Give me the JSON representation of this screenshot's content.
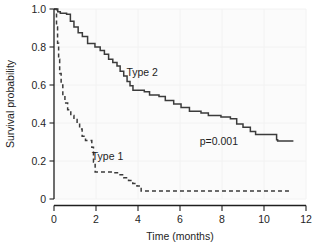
{
  "chart_data": {
    "type": "line",
    "title": "",
    "subtitle": "",
    "xlabel": "Time (months)",
    "ylabel": "Survival probability",
    "xlim": [
      0,
      12
    ],
    "ylim": [
      0,
      1.0
    ],
    "xticks": [
      "0",
      "2",
      "4",
      "6",
      "8",
      "10",
      "12"
    ],
    "xtick_values": [
      0,
      2,
      4,
      6,
      8,
      10,
      12
    ],
    "yticks": [
      "0",
      "0.2",
      "0.4",
      "0.6",
      "0.8",
      "1.0"
    ],
    "ytick_values": [
      0,
      0.2,
      0.4,
      0.6,
      0.8,
      1.0
    ],
    "grid": true,
    "legend_position": "inline-annotations",
    "annotations": [
      {
        "text": "Type 2",
        "x": 4.2,
        "y": 0.645,
        "name": "type-2-curve-label"
      },
      {
        "text": "Type 1",
        "x": 2.55,
        "y": 0.205,
        "name": "type-1-curve-label"
      },
      {
        "text": "p=0.001",
        "x": 7.85,
        "y": 0.285,
        "name": "p-value-annotation"
      }
    ],
    "series": [
      {
        "name": "Type 2",
        "style": "solid",
        "color": "#3b3b3b",
        "step": "post",
        "points": [
          [
            0.0,
            1.0
          ],
          [
            0.18,
            1.0
          ],
          [
            0.22,
            0.985
          ],
          [
            0.3,
            0.985
          ],
          [
            0.34,
            0.978
          ],
          [
            0.6,
            0.978
          ],
          [
            0.64,
            0.972
          ],
          [
            0.78,
            0.972
          ],
          [
            0.82,
            0.935
          ],
          [
            0.95,
            0.935
          ],
          [
            1.0,
            0.905
          ],
          [
            1.15,
            0.905
          ],
          [
            1.2,
            0.875
          ],
          [
            1.35,
            0.875
          ],
          [
            1.4,
            0.855
          ],
          [
            1.6,
            0.855
          ],
          [
            1.65,
            0.818
          ],
          [
            1.95,
            0.818
          ],
          [
            2.0,
            0.8
          ],
          [
            2.2,
            0.8
          ],
          [
            2.25,
            0.782
          ],
          [
            2.4,
            0.782
          ],
          [
            2.45,
            0.762
          ],
          [
            2.6,
            0.762
          ],
          [
            2.65,
            0.735
          ],
          [
            2.8,
            0.735
          ],
          [
            2.85,
            0.718
          ],
          [
            3.0,
            0.718
          ],
          [
            3.05,
            0.7
          ],
          [
            3.15,
            0.7
          ],
          [
            3.2,
            0.672
          ],
          [
            3.32,
            0.672
          ],
          [
            3.36,
            0.648
          ],
          [
            3.48,
            0.648
          ],
          [
            3.52,
            0.618
          ],
          [
            3.62,
            0.618
          ],
          [
            3.66,
            0.596
          ],
          [
            3.76,
            0.596
          ],
          [
            3.8,
            0.572
          ],
          [
            4.3,
            0.572
          ],
          [
            4.34,
            0.565
          ],
          [
            4.55,
            0.565
          ],
          [
            4.6,
            0.548
          ],
          [
            5.0,
            0.548
          ],
          [
            5.05,
            0.54
          ],
          [
            5.3,
            0.54
          ],
          [
            5.35,
            0.518
          ],
          [
            5.7,
            0.518
          ],
          [
            5.75,
            0.5
          ],
          [
            6.05,
            0.5
          ],
          [
            6.1,
            0.482
          ],
          [
            6.45,
            0.482
          ],
          [
            6.5,
            0.462
          ],
          [
            7.0,
            0.462
          ],
          [
            7.05,
            0.452
          ],
          [
            7.35,
            0.452
          ],
          [
            7.4,
            0.44
          ],
          [
            7.95,
            0.44
          ],
          [
            8.0,
            0.432
          ],
          [
            8.4,
            0.432
          ],
          [
            8.45,
            0.422
          ],
          [
            8.7,
            0.422
          ],
          [
            8.75,
            0.395
          ],
          [
            9.0,
            0.395
          ],
          [
            9.05,
            0.378
          ],
          [
            9.35,
            0.378
          ],
          [
            9.4,
            0.355
          ],
          [
            9.6,
            0.355
          ],
          [
            9.65,
            0.34
          ],
          [
            10.6,
            0.34
          ],
          [
            10.65,
            0.312
          ],
          [
            10.7,
            0.305
          ],
          [
            11.4,
            0.305
          ]
        ]
      },
      {
        "name": "Type 1",
        "style": "dashed",
        "color": "#3b3b3b",
        "step": "post",
        "points": [
          [
            0.0,
            1.0
          ],
          [
            0.12,
            1.0
          ],
          [
            0.14,
            0.905
          ],
          [
            0.17,
            0.905
          ],
          [
            0.19,
            0.82
          ],
          [
            0.22,
            0.82
          ],
          [
            0.24,
            0.735
          ],
          [
            0.27,
            0.735
          ],
          [
            0.3,
            0.66
          ],
          [
            0.34,
            0.66
          ],
          [
            0.37,
            0.6
          ],
          [
            0.42,
            0.6
          ],
          [
            0.46,
            0.545
          ],
          [
            0.52,
            0.545
          ],
          [
            0.57,
            0.505
          ],
          [
            0.65,
            0.505
          ],
          [
            0.7,
            0.47
          ],
          [
            0.8,
            0.47
          ],
          [
            0.85,
            0.44
          ],
          [
            0.95,
            0.44
          ],
          [
            1.0,
            0.418
          ],
          [
            1.1,
            0.418
          ],
          [
            1.15,
            0.4
          ],
          [
            1.22,
            0.4
          ],
          [
            1.26,
            0.368
          ],
          [
            1.34,
            0.368
          ],
          [
            1.38,
            0.33
          ],
          [
            1.5,
            0.33
          ],
          [
            1.54,
            0.308
          ],
          [
            1.8,
            0.308
          ],
          [
            1.84,
            0.272
          ],
          [
            1.88,
            0.272
          ],
          [
            1.92,
            0.195
          ],
          [
            1.96,
            0.195
          ],
          [
            2.0,
            0.142
          ],
          [
            2.85,
            0.142
          ],
          [
            2.9,
            0.138
          ],
          [
            3.1,
            0.138
          ],
          [
            3.15,
            0.128
          ],
          [
            3.32,
            0.128
          ],
          [
            3.36,
            0.112
          ],
          [
            3.55,
            0.112
          ],
          [
            3.6,
            0.098
          ],
          [
            3.75,
            0.098
          ],
          [
            3.8,
            0.082
          ],
          [
            3.95,
            0.082
          ],
          [
            4.0,
            0.068
          ],
          [
            4.15,
            0.068
          ],
          [
            4.2,
            0.042
          ],
          [
            11.3,
            0.042
          ]
        ]
      }
    ]
  },
  "axes": {
    "y_axis_title": "Survival probability",
    "x_axis_title": "Time (months)"
  }
}
